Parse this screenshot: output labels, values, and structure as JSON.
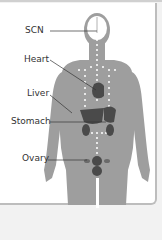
{
  "diagram": {
    "type": "anatomical-clock-locations",
    "labels": [
      {
        "id": "scn",
        "text": "SCN"
      },
      {
        "id": "heart",
        "text": "Heart"
      },
      {
        "id": "liver",
        "text": "Liver"
      },
      {
        "id": "stomach",
        "text": "Stomach"
      },
      {
        "id": "ovary",
        "text": "Ovary"
      }
    ],
    "colors": {
      "silhouette": "#9e9e9e",
      "organ": "#4a4a4a",
      "dots": "#ffffff",
      "leader": "#333333"
    }
  }
}
